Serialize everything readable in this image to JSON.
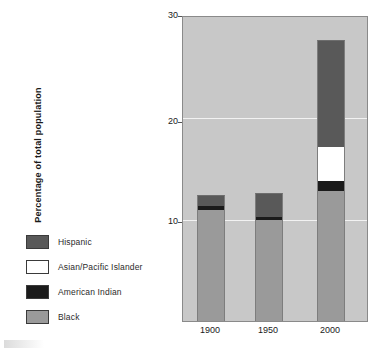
{
  "chart_data": {
    "type": "bar",
    "variant": "stacked",
    "title": "",
    "xlabel": "",
    "ylabel": "Percentage of total population",
    "categories": [
      "1900",
      "1950",
      "2000"
    ],
    "ylim": [
      0,
      30
    ],
    "yticks": [
      10,
      20,
      30
    ],
    "grid": true,
    "legend_position": "left",
    "series": [
      {
        "name": "Black",
        "color": "#9a9a9a",
        "values": [
          11.0,
          10.0,
          12.8
        ]
      },
      {
        "name": "American Indian",
        "color": "#1b1b1b",
        "values": [
          0.4,
          0.3,
          1.0
        ]
      },
      {
        "name": "Asian/Pacific Islander",
        "color": "#ffffff",
        "values": [
          0.0,
          0.0,
          3.4
        ]
      },
      {
        "name": "Hispanic",
        "color": "#595959",
        "values": [
          1.1,
          2.4,
          10.6
        ]
      }
    ],
    "totals": [
      12.5,
      12.7,
      27.8
    ],
    "plot_background": "#c8c8c8",
    "gridline_color": "#f2f2f2"
  },
  "legend": {
    "items": [
      {
        "label": "Hispanic",
        "color": "#595959"
      },
      {
        "label": "Asian/Pacific Islander",
        "color": "#ffffff"
      },
      {
        "label": "American Indian",
        "color": "#1b1b1b"
      },
      {
        "label": "Black",
        "color": "#9a9a9a"
      }
    ]
  },
  "axis": {
    "y_title": "Percentage of total population",
    "y_ticks": [
      "30",
      "20",
      "10"
    ],
    "x_ticks": [
      "1900",
      "1950",
      "2000"
    ]
  }
}
